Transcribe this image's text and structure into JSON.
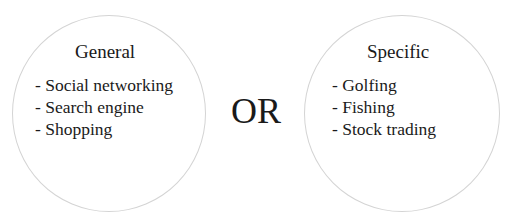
{
  "diagram": {
    "left": {
      "title": "General",
      "items": [
        "- Social networking",
        "- Search engine",
        "- Shopping"
      ]
    },
    "connector": "OR",
    "right": {
      "title": "Specific",
      "items": [
        "- Golfing",
        "- Fishing",
        "- Stock trading"
      ]
    },
    "colors": {
      "circle_border": "#d4d4d4",
      "text": "#1a1a1a",
      "background": "#ffffff"
    }
  }
}
